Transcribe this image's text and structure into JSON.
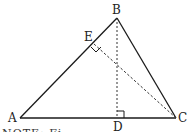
{
  "diagram": {
    "type": "triangle",
    "points": {
      "A": {
        "label": "A",
        "x": 20,
        "y": 118
      },
      "B": {
        "label": "B",
        "x": 117,
        "y": 18
      },
      "C": {
        "label": "C",
        "x": 176,
        "y": 118
      },
      "D": {
        "label": "D",
        "x": 117,
        "y": 118
      },
      "E": {
        "label": "E",
        "x": 94,
        "y": 44
      }
    },
    "solid_segments": [
      "AB",
      "BC",
      "AC"
    ],
    "dashed_segments": [
      "BD",
      "CE"
    ],
    "right_angles": [
      "D",
      "E"
    ],
    "stroke_color": "#1a1a1a"
  },
  "note": {
    "text": "NOTE: Fi"
  }
}
